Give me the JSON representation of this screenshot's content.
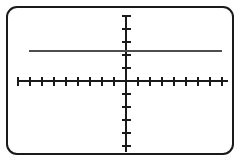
{
  "screen": {
    "width": 246,
    "height": 167,
    "background_color": "#ffffff",
    "border_color": "#1a1a1a",
    "border_radius": 11,
    "border_width": 2
  },
  "axis_style": {
    "color": "#1a1a1a",
    "line_width": 1.4,
    "tick_length_x": 9,
    "tick_length_y": 9
  },
  "plot_line": {
    "color": "#4d4d4d",
    "line_width": 2.4,
    "label": "horizontal-line"
  },
  "chart_data": {
    "type": "line",
    "title": "",
    "subtitle": "",
    "xlabel": "",
    "ylabel": "",
    "grid": false,
    "legend": false,
    "axes": {
      "x_axis": {
        "pixel_y": 81,
        "pixel_start": 18,
        "pixel_end": 228,
        "origin_pixel_x": 126,
        "tick_spacing_px": 12,
        "ticks_left": 9,
        "ticks_right": 8,
        "tick_values": [
          -9,
          -8,
          -7,
          -6,
          -5,
          -4,
          -3,
          -2,
          -1,
          1,
          2,
          3,
          4,
          5,
          6,
          7,
          8
        ],
        "tick_labels": [],
        "range": [
          -9,
          8.5
        ]
      },
      "y_axis": {
        "pixel_x": 126,
        "pixel_start": 15,
        "pixel_end": 152,
        "origin_pixel_y": 81,
        "tick_spacing_px": 13,
        "ticks_above": 5,
        "ticks_below": 5,
        "tick_values": [
          -5,
          -4,
          -3,
          -2,
          -1,
          1,
          2,
          3,
          4,
          5
        ],
        "tick_labels": [],
        "range": [
          -5.4,
          5.1
        ]
      }
    },
    "series": [
      {
        "name": "y = 2.3",
        "kind": "horizontal-line",
        "x": [
          -8.6,
          7.6
        ],
        "values": [
          2.3,
          2.3
        ],
        "y_constant": 2.3,
        "pixel_y": 51,
        "pixel_x_start": 29,
        "pixel_x_end": 222,
        "color": "#4d4d4d"
      }
    ],
    "annotations": []
  }
}
